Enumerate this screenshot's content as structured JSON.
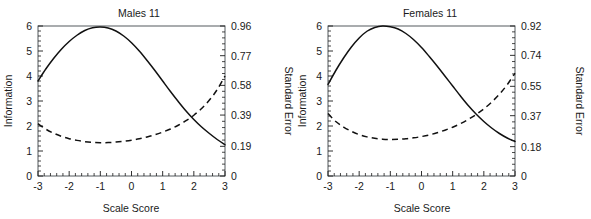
{
  "figure": {
    "title": "",
    "panels": [
      {
        "id": "males",
        "title": "Males 11",
        "xlabel": "Scale Score",
        "ylabel_left": "Information",
        "ylabel_right": "Standard Error",
        "x_ticks": [
          "-3",
          "-2",
          "-1",
          "0",
          "1",
          "2",
          "3"
        ],
        "y_left_ticks": [
          "0",
          "1",
          "2",
          "3",
          "4",
          "5",
          "6"
        ],
        "y_right_ticks": [
          "0",
          "0.19",
          "0.39",
          "0.58",
          "0.77",
          "0.96"
        ]
      },
      {
        "id": "females",
        "title": "Females 11",
        "xlabel": "Scale Score",
        "ylabel_left": "Information",
        "ylabel_right": "Standard Error",
        "x_ticks": [
          "-3",
          "-2",
          "-1",
          "0",
          "1",
          "2",
          "3"
        ],
        "y_left_ticks": [
          "0",
          "1",
          "2",
          "3",
          "4",
          "5",
          "6"
        ],
        "y_right_ticks": [
          "0",
          "0.18",
          "0.37",
          "0.55",
          "0.74",
          "0.92"
        ]
      }
    ]
  },
  "chart_data": [
    {
      "type": "line",
      "title": "Males 11",
      "xlabel": "Scale Score",
      "ylabel": "Information",
      "ylabel_secondary": "Standard Error",
      "xlim": [
        -3,
        3
      ],
      "ylim": [
        0,
        6
      ],
      "ylim_secondary": [
        0,
        0.96
      ],
      "grid": false,
      "legend": "none",
      "x_ticks": [
        -3,
        -2,
        -1,
        0,
        1,
        2,
        3
      ],
      "y_ticks_left": [
        0,
        1,
        2,
        3,
        4,
        5,
        6
      ],
      "y_ticks_right": [
        0,
        0.19,
        0.39,
        0.58,
        0.77,
        0.96
      ],
      "x": [
        -3.0,
        -2.75,
        -2.5,
        -2.25,
        -2.0,
        -1.75,
        -1.5,
        -1.25,
        -1.0,
        -0.75,
        -0.5,
        -0.25,
        0.0,
        0.25,
        0.5,
        0.75,
        1.0,
        1.25,
        1.5,
        1.75,
        2.0,
        2.25,
        2.5,
        2.75,
        3.0
      ],
      "series": [
        {
          "name": "Information",
          "style": "solid",
          "axis": "left",
          "values": [
            3.8,
            4.28,
            4.7,
            5.07,
            5.38,
            5.63,
            5.82,
            5.93,
            5.96,
            5.92,
            5.8,
            5.6,
            5.33,
            5.0,
            4.62,
            4.22,
            3.8,
            3.38,
            2.98,
            2.6,
            2.26,
            1.96,
            1.7,
            1.46,
            1.25
          ]
        },
        {
          "name": "Standard Error",
          "style": "dashed",
          "axis": "right",
          "values": [
            0.335,
            0.3,
            0.274,
            0.254,
            0.239,
            0.228,
            0.22,
            0.215,
            0.213,
            0.214,
            0.217,
            0.222,
            0.229,
            0.238,
            0.25,
            0.264,
            0.281,
            0.301,
            0.325,
            0.354,
            0.389,
            0.432,
            0.486,
            0.553,
            0.64
          ]
        }
      ]
    },
    {
      "type": "line",
      "title": "Females 11",
      "xlabel": "Scale Score",
      "ylabel": "Information",
      "ylabel_secondary": "Standard Error",
      "xlim": [
        -3,
        3
      ],
      "ylim": [
        0,
        6
      ],
      "ylim_secondary": [
        0,
        0.92
      ],
      "grid": false,
      "legend": "none",
      "x_ticks": [
        -3,
        -2,
        -1,
        0,
        1,
        2,
        3
      ],
      "y_ticks_left": [
        0,
        1,
        2,
        3,
        4,
        5,
        6
      ],
      "y_ticks_right": [
        0,
        0.18,
        0.37,
        0.55,
        0.74,
        0.92
      ],
      "x": [
        -3.0,
        -2.75,
        -2.5,
        -2.25,
        -2.0,
        -1.75,
        -1.5,
        -1.25,
        -1.0,
        -0.75,
        -0.5,
        -0.25,
        0.0,
        0.25,
        0.5,
        0.75,
        1.0,
        1.25,
        1.5,
        1.75,
        2.0,
        2.25,
        2.5,
        2.75,
        3.0
      ],
      "series": [
        {
          "name": "Information",
          "style": "solid",
          "axis": "left",
          "values": [
            3.66,
            4.22,
            4.72,
            5.16,
            5.52,
            5.79,
            5.94,
            6.0,
            5.97,
            5.88,
            5.7,
            5.45,
            5.14,
            4.78,
            4.4,
            4.0,
            3.6,
            3.2,
            2.82,
            2.48,
            2.18,
            1.92,
            1.7,
            1.52,
            1.38
          ]
        },
        {
          "name": "Standard Error",
          "style": "dashed",
          "axis": "right",
          "values": [
            0.383,
            0.334,
            0.3,
            0.274,
            0.254,
            0.24,
            0.231,
            0.226,
            0.224,
            0.225,
            0.228,
            0.234,
            0.242,
            0.252,
            0.265,
            0.281,
            0.299,
            0.321,
            0.347,
            0.377,
            0.412,
            0.453,
            0.502,
            0.56,
            0.63
          ]
        }
      ]
    }
  ]
}
